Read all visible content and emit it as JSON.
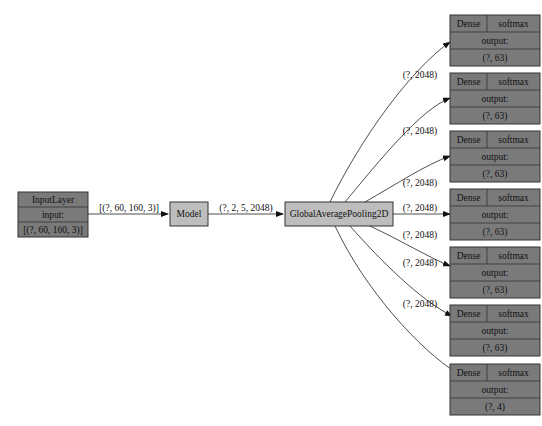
{
  "diagram": {
    "type": "keras-model-graph",
    "input_layer": {
      "title": "InputLayer",
      "field": "input:",
      "shape": "[(?, 60, 160, 3)]"
    },
    "model_node": {
      "title": "Model"
    },
    "pooling_node": {
      "title": "GlobalAveragePooling2D"
    },
    "edges": {
      "input_to_model": "[(?, 60, 160, 3)]",
      "model_to_pool": "(?, 2, 5, 2048)",
      "pool_to_dense": [
        "(?, 2048)",
        "(?, 2048)",
        "(?, 2048)",
        "(?, 2048)",
        "(?, 2048)",
        "(?, 2048)",
        "(?, 2048)"
      ]
    },
    "dense_nodes": [
      {
        "layer": "Dense",
        "activation": "softmax",
        "field": "output:",
        "shape": "(?, 63)"
      },
      {
        "layer": "Dense",
        "activation": "softmax",
        "field": "output:",
        "shape": "(?, 63)"
      },
      {
        "layer": "Dense",
        "activation": "softmax",
        "field": "output:",
        "shape": "(?, 63)"
      },
      {
        "layer": "Dense",
        "activation": "softmax",
        "field": "output:",
        "shape": "(?, 63)"
      },
      {
        "layer": "Dense",
        "activation": "softmax",
        "field": "output:",
        "shape": "(?, 63)"
      },
      {
        "layer": "Dense",
        "activation": "softmax",
        "field": "output:",
        "shape": "(?, 63)"
      },
      {
        "layer": "Dense",
        "activation": "softmax",
        "field": "output:",
        "shape": "(?, 4)"
      }
    ],
    "colors": {
      "dark_node": "#7a7a7a",
      "light_node": "#bdbdbd",
      "stroke": "#333333",
      "background": "#ffffff"
    }
  }
}
